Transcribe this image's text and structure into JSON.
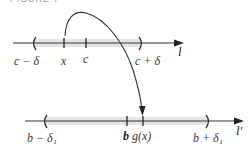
{
  "figure": {
    "caption": "FIGURE 7"
  },
  "top_line": {
    "name": "l",
    "left_bound_label": "c − δ",
    "point_x_label": "x",
    "point_c_label": "c",
    "right_bound_label": "c + δ"
  },
  "bottom_line": {
    "name": "l′",
    "left_bound_label": "b − δ₁",
    "point_b_label": "b",
    "point_gx_label": "g(x)",
    "right_bound_label": "b + δ₁"
  },
  "mapping_arrow": {
    "from": "x",
    "to": "g(x)"
  },
  "colors": {
    "line": "#333333",
    "band": "#e4e4e4",
    "text": "#3a3a3a"
  }
}
